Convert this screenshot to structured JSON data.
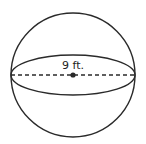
{
  "figure": {
    "shape": "sphere",
    "radius_label": "9 ft.",
    "colors": {
      "stroke": "#2a2a2a",
      "background": "#ffffff"
    }
  }
}
